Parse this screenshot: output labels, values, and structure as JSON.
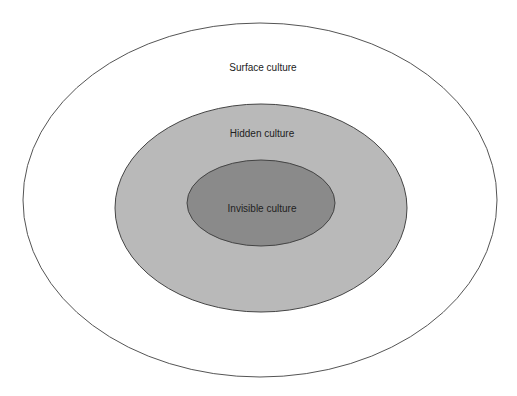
{
  "diagram": {
    "type": "nested-ellipses",
    "layers": [
      {
        "id": "outer",
        "label": "Surface culture",
        "fill": "#ffffff",
        "stroke": "#555555"
      },
      {
        "id": "middle",
        "label": "Hidden culture",
        "fill": "#b9b9b9",
        "stroke": "#444444"
      },
      {
        "id": "inner",
        "label": "Invisible culture",
        "fill": "#8a8a8a",
        "stroke": "#444444"
      }
    ]
  }
}
